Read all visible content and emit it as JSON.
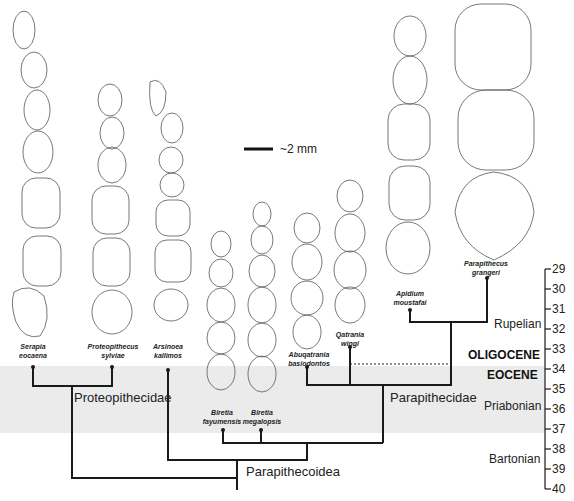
{
  "scale_bar": {
    "label": "~2 mm"
  },
  "taxa": [
    {
      "genus": "Serapia",
      "species": "eocaena"
    },
    {
      "genus": "Proteopithecus",
      "species": "sylviae"
    },
    {
      "genus": "Arsinoea",
      "species": "kallimos"
    },
    {
      "genus": "Biretia",
      "species": "fayumensis"
    },
    {
      "genus": "Biretia",
      "species": "megalopsis"
    },
    {
      "genus": "Abuqatrania",
      "species": "basiodontos"
    },
    {
      "genus": "Qatrania",
      "species": "wingi"
    },
    {
      "genus": "Apidium",
      "species": "moustafai"
    },
    {
      "genus": "Parapithecus",
      "species": "grangeri"
    }
  ],
  "clades": {
    "proteopithecidae": "Proteopithecidae",
    "parapithecidae": "Parapithecidae",
    "parapithecoidea": "Parapithecoidea"
  },
  "epochs": {
    "oligocene": "OLIGOCENE",
    "eocene": "EOCENE"
  },
  "stages": {
    "rupelian": "Rupelian",
    "priabonian": "Priabonian",
    "bartonian": "Bartonian"
  },
  "time_axis": {
    "unit": "Ma",
    "ticks": [
      "29",
      "30",
      "31",
      "32",
      "33",
      "34",
      "35",
      "36",
      "37",
      "38",
      "39",
      "40"
    ]
  },
  "colors": {
    "eocene_band": "#ebebeb",
    "line": "#1a1a1a"
  }
}
